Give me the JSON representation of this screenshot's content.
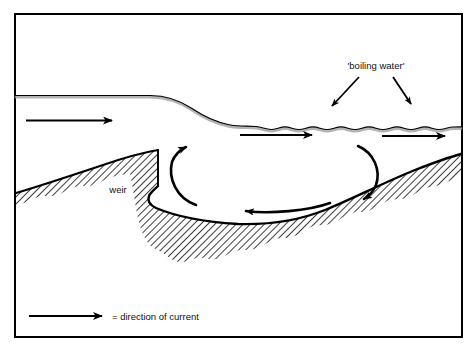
{
  "figure": {
    "type": "hydrology-cross-section-diagram",
    "background_color": "#ffffff",
    "ink_color": "#000000",
    "surface_shadow_color": "#9a9a9a",
    "border": {
      "visible": true,
      "color": "#000000",
      "thickness_px": 2
    }
  },
  "labels": {
    "boiling_water": "'boiling water'",
    "weir": "weir",
    "legend_text": "= direction of current"
  },
  "annotations": {
    "boiling_water_arrows": 2,
    "boiling_water_arrow_targets": "wavy downstream water surface"
  },
  "flow_arrows": {
    "upstream_surface": {
      "label": "direction of current",
      "direction": "right"
    },
    "downstream_mid": {
      "label": "direction of current",
      "direction": "right"
    },
    "downstream_right": {
      "label": "direction of current",
      "direction": "right"
    },
    "eddy_up_left": {
      "label": "eddy upwelling",
      "direction": "up"
    },
    "eddy_down_right": {
      "label": "eddy downwelling",
      "direction": "down"
    },
    "eddy_return_bottom": {
      "label": "eddy return flow",
      "direction": "left"
    }
  },
  "features": {
    "water_surface": "flat upstream, drops over weir crest, undulating downstream",
    "riverbed": "hatched bank rising to weir on left, scour pool, bed rising to right",
    "weir_structure": "vertical drop with rounded toe"
  },
  "legend": {
    "symbol": "right-arrow",
    "text": "= direction of current"
  }
}
